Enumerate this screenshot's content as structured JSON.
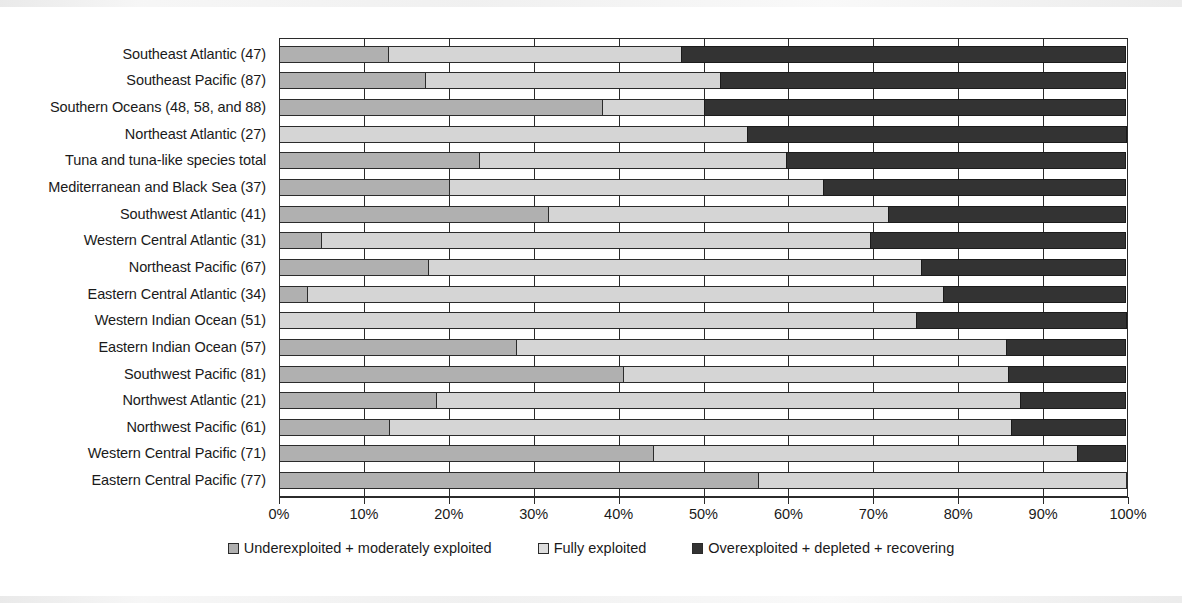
{
  "chart_data": {
    "type": "bar",
    "orientation": "horizontal",
    "stacked": true,
    "stack_mode": "percent",
    "title": "",
    "subtitle": "",
    "xlabel": "",
    "ylabel": "",
    "xlim": [
      0,
      100
    ],
    "xticks": [
      0,
      10,
      20,
      30,
      40,
      50,
      60,
      70,
      80,
      90,
      100
    ],
    "xticklabels": [
      "0%",
      "10%",
      "20%",
      "30%",
      "40%",
      "50%",
      "60%",
      "70%",
      "80%",
      "90%",
      "100%"
    ],
    "grid": true,
    "grid_axis": "x",
    "legend_position": "bottom",
    "categories": [
      "Southeast Atlantic (47)",
      "Southeast  Pacific (87)",
      "Southern Oceans (48, 58, and 88)",
      "Northeast Atlantic (27)",
      "Tuna and tuna-like species total",
      "Mediterranean and Black Sea (37)",
      "Southwest Atlantic (41)",
      "Western Central Atlantic (31)",
      "Northeast Pacific (67)",
      "Eastern Central Atlantic (34)",
      "Western Indian Ocean (51)",
      "Eastern Indian Ocean (57)",
      "Southwest Pacific (81)",
      "Northwest Atlantic (21)",
      "Northwest Pacific (61)",
      "Western Central Pacific (71)",
      "Eastern Central Pacific (77)"
    ],
    "series": [
      {
        "name": "Underexploited + moderately exploited",
        "color": "#b0b0b0",
        "values": [
          13.0,
          17.3,
          38.2,
          0.0,
          23.7,
          20.1,
          31.8,
          5.1,
          17.7,
          3.4,
          0.0,
          28.0,
          40.6,
          18.6,
          13.1,
          44.2,
          56.5
        ]
      },
      {
        "name": "Fully exploited",
        "color": "#d5d5d5",
        "values": [
          34.6,
          34.9,
          12.1,
          55.3,
          36.3,
          44.2,
          40.2,
          64.7,
          58.1,
          75.1,
          75.1,
          57.9,
          45.5,
          68.9,
          73.3,
          50.0,
          43.5
        ]
      },
      {
        "name": "Overexploited + depleted + recovering",
        "color": "#333333",
        "values": [
          52.4,
          47.8,
          49.7,
          44.7,
          40.0,
          35.7,
          28.0,
          30.2,
          24.2,
          21.5,
          24.9,
          14.1,
          13.9,
          12.5,
          13.6,
          5.8,
          0.0
        ]
      }
    ],
    "legend": [
      {
        "label": "Underexploited + moderately exploited",
        "swatch": "light-gray-swatch"
      },
      {
        "label": "Fully exploited",
        "swatch": "pale-gray-swatch"
      },
      {
        "label": "Overexploited + depleted + recovering",
        "swatch": "dark-gray-swatch"
      }
    ]
  }
}
